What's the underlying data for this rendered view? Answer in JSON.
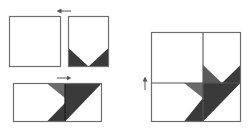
{
  "diagram": {
    "colors": {
      "background": "#ffffff",
      "outline": "#6e6e6e",
      "fabric_white": "#ffffff",
      "fabric_medium": "#6a6a6a",
      "fabric_dark": "#3a3a3a",
      "arrow": "#555555"
    },
    "pieces": [
      {
        "id": "plain-square",
        "label": ""
      },
      {
        "id": "v-triangle-rectangle",
        "label": ""
      },
      {
        "id": "joined-strip",
        "label": ""
      },
      {
        "id": "finished-block",
        "label": ""
      }
    ],
    "arrows": [
      {
        "id": "arrow-join-top",
        "direction": "left"
      },
      {
        "id": "arrow-join-strip",
        "direction": "right"
      },
      {
        "id": "arrow-join-block",
        "direction": "up"
      }
    ]
  }
}
